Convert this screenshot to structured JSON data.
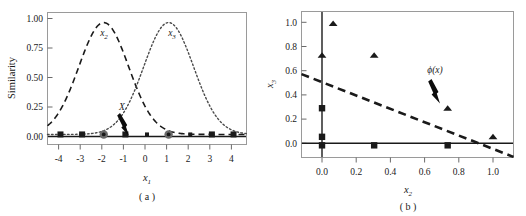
{
  "figure": {
    "panel_a_caption": "( a )",
    "panel_b_caption": "( b )"
  },
  "chart_data": [
    {
      "type": "line",
      "panel": "a",
      "title": "",
      "xlabel": "x1",
      "ylabel": "Similarity",
      "xlim": [
        -4.6,
        4.6
      ],
      "ylim": [
        -0.09,
        1.09
      ],
      "xticks": [
        -4,
        -3,
        -2,
        -1,
        0,
        1,
        2,
        3,
        4
      ],
      "xtick_labels": [
        "-4",
        "-3",
        "-2",
        "-1",
        "0",
        "1",
        "2",
        "3",
        "4"
      ],
      "yticks": [
        0.0,
        0.25,
        0.5,
        0.75,
        1.0
      ],
      "ytick_labels": [
        "0.00",
        "0.25",
        "0.50",
        "0.75",
        "1.00"
      ],
      "grid": false,
      "legend": "none",
      "series": [
        {
          "name": "x2",
          "label": "x2",
          "style": "dashed",
          "kind": "gaussian",
          "center": -2.0,
          "sigma": 1.15,
          "amplitude": 1.0,
          "label_x": -1.75,
          "label_y": 0.9
        },
        {
          "name": "x3",
          "label": "x3",
          "style": "dotted",
          "kind": "gaussian",
          "center": 1.0,
          "sigma": 1.15,
          "amplitude": 1.0,
          "label_x": 1.25,
          "label_y": 0.9
        }
      ],
      "baseline_points": [
        {
          "x": -4,
          "y": 0.0,
          "marker": "square"
        },
        {
          "x": -3,
          "y": 0.0,
          "marker": "square"
        },
        {
          "x": -2,
          "y": 0.0,
          "marker": "circle"
        },
        {
          "x": -1,
          "y": 0.0,
          "marker": "square"
        },
        {
          "x": 0,
          "y": 0.0,
          "marker": "square-small"
        },
        {
          "x": 1,
          "y": 0.0,
          "marker": "circle"
        },
        {
          "x": 2,
          "y": 0.0,
          "marker": "square-small"
        },
        {
          "x": 3,
          "y": 0.0,
          "marker": "square"
        },
        {
          "x": 4,
          "y": 0.0,
          "marker": "square"
        }
      ],
      "annotations": [
        {
          "text": "X",
          "x": -1.0,
          "y": 0.0,
          "label_x": -1.1,
          "label_y": 0.28,
          "arrow": true
        }
      ]
    },
    {
      "type": "scatter",
      "panel": "b",
      "title": "",
      "xlabel": "x2",
      "ylabel": "x3",
      "xlim": [
        -0.12,
        1.12
      ],
      "ylim": [
        -0.1,
        1.1
      ],
      "xticks": [
        0.0,
        0.2,
        0.4,
        0.6,
        0.8,
        1.0
      ],
      "xtick_labels": [
        "0.0",
        "0.2",
        "0.4",
        "0.6",
        "0.8",
        "1.0"
      ],
      "yticks": [
        0.0,
        0.2,
        0.4,
        0.6,
        0.8,
        1.0
      ],
      "ytick_labels": [
        "0.0",
        "0.2",
        "0.4",
        "0.6",
        "0.8",
        "1.0"
      ],
      "grid": false,
      "legend": "none",
      "series": [
        {
          "name": "triangles",
          "marker": "triangle",
          "points": [
            {
              "x": 0.065,
              "y": 1.0
            },
            {
              "x": 0.0,
              "y": 0.74
            },
            {
              "x": 0.305,
              "y": 0.74
            },
            {
              "x": 0.735,
              "y": 0.305
            },
            {
              "x": 1.0,
              "y": 0.07
            }
          ]
        },
        {
          "name": "squares",
          "marker": "square",
          "points": [
            {
              "x": 0.0,
              "y": 0.305
            },
            {
              "x": 0.0,
              "y": 0.07
            },
            {
              "x": 0.0,
              "y": 0.0
            },
            {
              "x": 0.305,
              "y": 0.0
            },
            {
              "x": 0.735,
              "y": 0.0
            }
          ]
        }
      ],
      "decision_boundary": {
        "style": "dashed",
        "x_start": -0.12,
        "y_start": 0.585,
        "x_end": 1.12,
        "y_end": -0.095
      },
      "annotations": [
        {
          "text": "phi(x)",
          "display": "ϕ(x)",
          "label_x": 0.745,
          "label_y": 0.58,
          "arrow": true,
          "arrow_to_y": 0.36
        }
      ]
    }
  ]
}
